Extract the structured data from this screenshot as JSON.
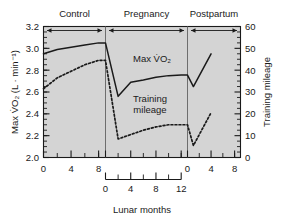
{
  "chart_data": {
    "type": "line",
    "title": "",
    "xlabel": "Lunar months",
    "ylabel": "Max V̇O₂ (L · min⁻¹)",
    "y2label": "Training mileage",
    "ylim": [
      2.0,
      3.2
    ],
    "y2lim": [
      0,
      60
    ],
    "yticks": [
      "2.0",
      "2.2",
      "2.4",
      "2.6",
      "2.8",
      "3.0",
      "3.2"
    ],
    "ytick_values": [
      2.0,
      2.2,
      2.4,
      2.6,
      2.8,
      3.0,
      3.2
    ],
    "y2ticks": [
      "0",
      "10",
      "20",
      "30",
      "40",
      "50",
      "60"
    ],
    "y2tick_values": [
      0,
      10,
      20,
      30,
      40,
      50,
      60
    ],
    "grid": false,
    "legend_position": "in-plot annotations",
    "phases": [
      {
        "name": "Control",
        "x_start": 0,
        "x_end": 9,
        "tick_labels": [
          "0",
          "4",
          "8"
        ],
        "tick_values": [
          0,
          4,
          8
        ],
        "minor_step": 2
      },
      {
        "name": "Pregnancy",
        "x_start": 0,
        "x_end": 13,
        "tick_labels": [
          "0",
          "4",
          "8",
          "12"
        ],
        "tick_values": [
          0,
          4,
          8,
          12
        ],
        "minor_step": 2
      },
      {
        "name": "Postpartum",
        "x_start": 0,
        "x_end": 9,
        "tick_labels": [
          "0",
          "4",
          "8"
        ],
        "tick_values": [
          0,
          4,
          8
        ],
        "minor_step": 2
      }
    ],
    "series": [
      {
        "name": "Max V̇O₂",
        "label": "Max V̇O₂",
        "style": "solid",
        "axis": "left",
        "units": "L · min⁻¹",
        "segments": [
          {
            "phase": "Control",
            "points": [
              [
                0,
                2.95
              ],
              [
                2,
                2.99
              ],
              [
                4,
                3.01
              ],
              [
                6,
                3.03
              ],
              [
                8,
                3.05
              ]
            ]
          },
          {
            "phase": "Pregnancy",
            "points": [
              [
                0,
                3.05
              ],
              [
                2,
                2.56
              ],
              [
                4,
                2.69
              ],
              [
                6,
                2.71
              ],
              [
                8,
                2.735
              ],
              [
                10,
                2.75
              ],
              [
                12,
                2.755
              ]
            ]
          },
          {
            "phase": "Postpartum",
            "points": [
              [
                0,
                2.755
              ],
              [
                1,
                2.65
              ],
              [
                4,
                2.95
              ]
            ]
          }
        ]
      },
      {
        "name": "Training mileage",
        "label": "Training mileage",
        "style": "dotted",
        "axis": "right",
        "units": "miles",
        "segments": [
          {
            "phase": "Control",
            "points": [
              [
                0,
                31.5
              ],
              [
                2,
                36.5
              ],
              [
                4,
                39.5
              ],
              [
                6,
                42.5
              ],
              [
                8,
                44.5
              ]
            ]
          },
          {
            "phase": "Pregnancy",
            "points": [
              [
                0,
                44.5
              ],
              [
                2,
                8.5
              ],
              [
                4,
                10.5
              ],
              [
                6,
                12.5
              ],
              [
                8,
                14.0
              ],
              [
                10,
                15.0
              ],
              [
                12,
                15.0
              ]
            ]
          },
          {
            "phase": "Postpartum",
            "points": [
              [
                0,
                15.0
              ],
              [
                1,
                5.5
              ],
              [
                4,
                20.5
              ]
            ]
          }
        ]
      }
    ],
    "annotations": [
      {
        "text": "Max V̇O₂",
        "x_px": 152,
        "y_px": 62
      },
      {
        "text": "Training",
        "x_px": 150,
        "y_px": 102
      },
      {
        "text": "mileage",
        "x_px": 150,
        "y_px": 113
      }
    ],
    "colors": {
      "plot_background": "#d4d4d4",
      "line": "#1a1a1a",
      "axis": "#1a1a1a",
      "divider": "#6e6e6e",
      "text": "#1a1a1a",
      "page_background": "#ffffff"
    }
  }
}
